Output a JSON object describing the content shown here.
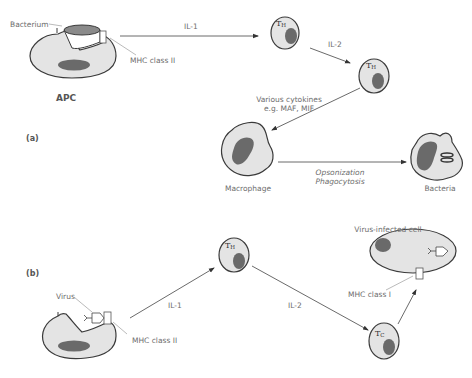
{
  "panels": {
    "a": {
      "label": "(a)",
      "apc_label": "APC",
      "bacterium_label": "Bacterium",
      "mhc_label": "MHC class II",
      "il1_label": "IL-1",
      "th1_tag": "T",
      "th1_sub": "H",
      "il2_label": "IL-2",
      "th2_tag": "T",
      "th2_sub": "H",
      "cytokines_line1": "Various cytokines",
      "cytokines_line2": "e.g. MAF, MIF",
      "macrophage_label": "Macrophage",
      "process_line1": "Opsonization",
      "process_line2": "Phagocytosis",
      "bacteria_label": "Bacteria"
    },
    "b": {
      "label": "(b)",
      "virus_label": "Virus",
      "mhc2_label": "MHC class II",
      "il1_label": "IL-1",
      "th_tag": "T",
      "th_sub": "H",
      "il2_label": "IL-2",
      "tc_tag": "T",
      "tc_sub": "C",
      "mhc1_label": "MHC class I",
      "infected_label": "Virus-infected cell"
    }
  },
  "colors": {
    "cell_fill": "#e4e4e4",
    "nucleus": "#6a6a6a",
    "outline": "#3a3a3a",
    "text": "#6d6d6d"
  }
}
